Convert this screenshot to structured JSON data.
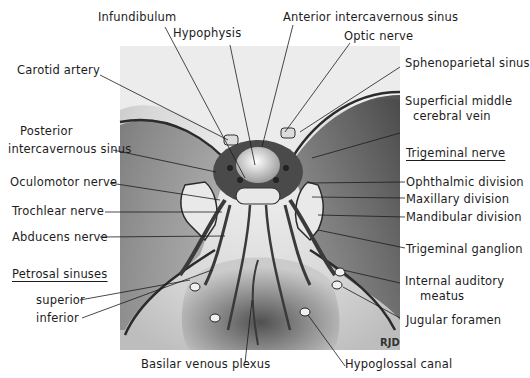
{
  "figure": {
    "signature": "RJD",
    "colors": {
      "background": "#ffffff",
      "ink": "#1c1c1c",
      "illustration_dark": "#2a2a2a",
      "illustration_light": "#e6e6e6"
    }
  },
  "labels": {
    "infundibulum": "Infundibulum",
    "hypophysis": "Hypophysis",
    "anterior_intercavernous_sinus": "Anterior intercavernous sinus",
    "optic_nerve": "Optic nerve",
    "carotid_artery": "Carotid artery",
    "sphenoparietal_sinus": "Sphenoparietal sinus",
    "superficial_middle_cerebral_vein_1": "Superficial middle",
    "superficial_middle_cerebral_vein_2": "cerebral vein",
    "posterior_intercavernous_sinus_1": "Posterior",
    "posterior_intercavernous_sinus_2": "intercavernous sinus",
    "trigeminal_nerve_heading": "Trigeminal nerve",
    "ophthalmic_division": "Ophthalmic division",
    "oculomotor_nerve": "Oculomotor nerve",
    "maxillary_division": "Maxillary division",
    "trochlear_nerve": "Trochlear nerve",
    "mandibular_division": "Mandibular division",
    "abducens_nerve": "Abducens nerve",
    "trigeminal_ganglion": "Trigeminal ganglion",
    "petrosal_sinuses_heading": "Petrosal sinuses",
    "internal_auditory_meatus_1": "Internal auditory",
    "internal_auditory_meatus_2": "meatus",
    "superior": "superior",
    "inferior": "inferior",
    "jugular_foramen": "Jugular foramen",
    "basilar_venous_plexus": "Basilar venous plexus",
    "hypoglossal_canal": "Hypoglossal canal"
  }
}
